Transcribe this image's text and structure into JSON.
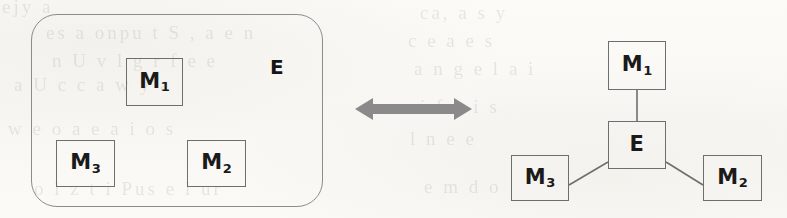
{
  "diagram": {
    "type": "equivalence-diagram",
    "title": "",
    "background_color": "#fbfaf7",
    "stroke_color": "#6e6e6e",
    "text_color": "#1a1a1a",
    "arrow_color": "#8a8a8a",
    "left_panel": {
      "name": "containment-view",
      "container": {
        "label": "E",
        "shape": "rounded-rectangle"
      },
      "nodes": [
        {
          "id": "m1",
          "base": "M",
          "sub": "1",
          "label": "M1"
        },
        {
          "id": "m3",
          "base": "M",
          "sub": "3",
          "label": "M3"
        },
        {
          "id": "m2",
          "base": "M",
          "sub": "2",
          "label": "M2"
        }
      ]
    },
    "connector": {
      "name": "equivalence-arrow",
      "style": "double-headed-horizontal",
      "label": ""
    },
    "right_panel": {
      "name": "graph-view",
      "nodes": [
        {
          "id": "m1",
          "base": "M",
          "sub": "1",
          "label": "M1"
        },
        {
          "id": "e",
          "base": "E",
          "sub": "",
          "label": "E"
        },
        {
          "id": "m3",
          "base": "M",
          "sub": "3",
          "label": "M3"
        },
        {
          "id": "m2",
          "base": "M",
          "sub": "2",
          "label": "M2"
        }
      ],
      "edges": [
        {
          "from": "m1",
          "to": "e"
        },
        {
          "from": "e",
          "to": "m3"
        },
        {
          "from": "e",
          "to": "m2"
        }
      ]
    },
    "ghost_text": [
      {
        "text": "ejy a",
        "x": 2,
        "y": -4
      },
      {
        "text": "es a  onpu t S ,  a e n",
        "x": 46,
        "y": 22
      },
      {
        "text": "n U  v l g  r  f e  e",
        "x": 52,
        "y": 50
      },
      {
        "text": "a  U  c  c  a w  y  a",
        "x": 14,
        "y": 74
      },
      {
        "text": "w e  o  a e  a  i o  s",
        "x": 8,
        "y": 118
      },
      {
        "text": "o  l z   t  i    Pus   e l   ur",
        "x": 34,
        "y": 178
      },
      {
        "text": "ca,       a       s         y",
        "x": 420,
        "y": 2
      },
      {
        "text": "c     e         a  e        s",
        "x": 408,
        "y": 30
      },
      {
        "text": "a     n   g  e      l   a   i",
        "x": 414,
        "y": 58
      },
      {
        "text": "i    f        n  i       s",
        "x": 420,
        "y": 96
      },
      {
        "text": "l    n e           e",
        "x": 410,
        "y": 128
      },
      {
        "text": "e        m      d     o",
        "x": 424,
        "y": 176
      }
    ]
  }
}
